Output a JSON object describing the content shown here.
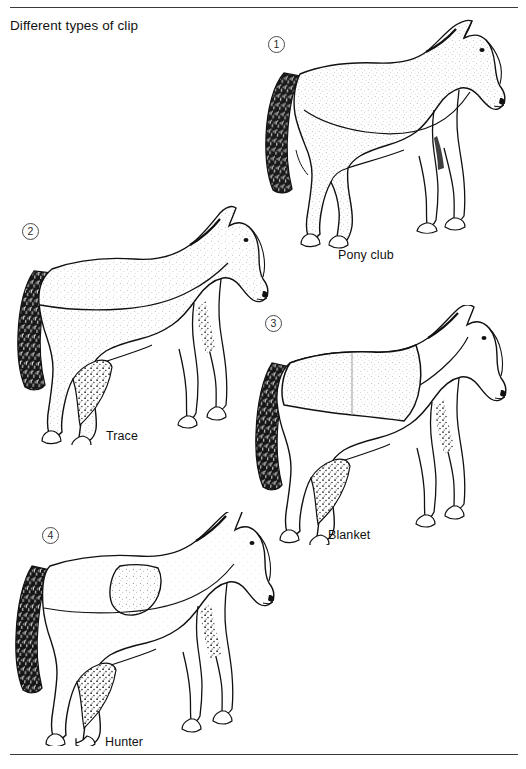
{
  "page": {
    "title": "Different types of clip",
    "background_color": "#ffffff",
    "ink_color": "#111111",
    "rule_color": "#3a3a3a",
    "top_rule": true,
    "bottom_rule": true
  },
  "figures": [
    {
      "number": "1",
      "caption": "Pony club",
      "clip_name": "Pony club clip",
      "clipped_region": "legs and tail base only; body and neck unclipped",
      "shading": "stippled body with dark hatched tail"
    },
    {
      "number": "2",
      "caption": "Trace",
      "clip_name": "Trace clip",
      "clipped_region": "lower body along belly line, legs shaded dark",
      "shading": "stippled upper body, dark hatched tail and legs"
    },
    {
      "number": "3",
      "caption": "Blanket",
      "clip_name": "Blanket clip",
      "clipped_region": "blanket-shaped area left unclipped over back and loins",
      "shading": "stippled blanket panel, dark hatched tail and legs"
    },
    {
      "number": "4",
      "caption": "Hunter",
      "clip_name": "Hunter clip",
      "clipped_region": "all coat removed except saddle patch and legs",
      "shading": "stippled saddle patch, dark hatched tail and legs"
    }
  ],
  "icons": {
    "circled_number": "circle-number-badge",
    "horse": "horse-side-view-illustration"
  }
}
